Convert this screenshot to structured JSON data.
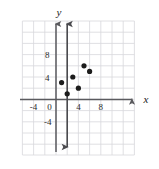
{
  "figure": {
    "name": "coordinate-plane-scatter",
    "background_color": "#ffffff",
    "grid_color": "#d8d8dc",
    "axis_color": "#5a5a5e",
    "point_color": "#1c1c1c",
    "vertical_line_color": "#4a4a4e"
  },
  "axes": {
    "x_label": "x",
    "y_label": "y",
    "x_ticks": [
      {
        "value": -4,
        "label": "-4"
      },
      {
        "value": 4,
        "label": "4"
      },
      {
        "value": 8,
        "label": "8"
      }
    ],
    "y_ticks": [
      {
        "value": 8,
        "label": "8"
      },
      {
        "value": 4,
        "label": "4"
      },
      {
        "value": -4,
        "label": "-4"
      }
    ],
    "origin_label": "0",
    "x_range": [
      -7,
      11
    ],
    "y_range": [
      -7,
      11
    ],
    "grid": true,
    "grid_step": 2,
    "arrows": [
      "x-positive",
      "y-positive"
    ]
  },
  "chart_data": {
    "type": "scatter",
    "title": "",
    "xlabel": "x",
    "ylabel": "y",
    "xlim": [
      -7,
      11
    ],
    "ylim": [
      -7,
      11
    ],
    "grid": true,
    "legend": null,
    "points": [
      {
        "x": 1,
        "y": 3
      },
      {
        "x": 2,
        "y": 1
      },
      {
        "x": 3,
        "y": 4
      },
      {
        "x": 4,
        "y": 2
      },
      {
        "x": 5,
        "y": 6
      },
      {
        "x": 6,
        "y": 5
      }
    ],
    "annotations": [
      {
        "type": "vertical-line",
        "x": 2,
        "label": "",
        "arrows": [
          "up",
          "down"
        ]
      }
    ]
  }
}
